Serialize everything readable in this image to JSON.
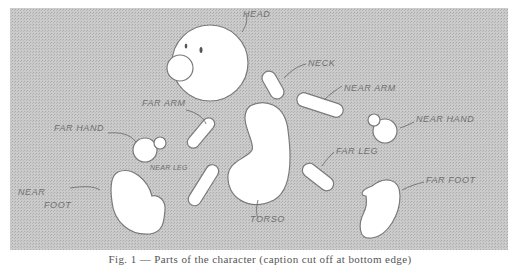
{
  "figure": {
    "background_color": "#c4c4c4",
    "shape_fill": "#ffffff",
    "outline_color": "#7a7a7a",
    "label_color": "#6f6f6f",
    "caption": "Fig. 1 — Parts of the character (caption cut off at bottom edge)"
  },
  "labels": {
    "head": "Head",
    "neck": "Neck",
    "far_arm": "Far Arm",
    "near_arm": "Near Arm",
    "far_hand": "Far Hand",
    "near_hand": "Near Hand",
    "near_leg": "Near Leg",
    "far_leg": "Far Leg",
    "torso": "Torso",
    "near_foot_line1": "Near",
    "near_foot_line2": "Foot",
    "far_foot": "Far Foot"
  }
}
